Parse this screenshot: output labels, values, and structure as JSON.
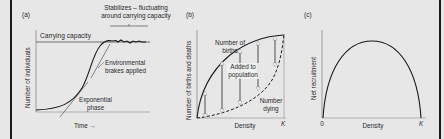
{
  "figure": {
    "background": "#e7e7e8",
    "panels": [
      {
        "label": "(a)",
        "y_axis_label": "Number of individuals",
        "x_axis_label": "Time →",
        "annotations": {
          "carrying_capacity": "Carrying capacity",
          "stabilizes_line1": "Stabilizes – fluctuating",
          "stabilizes_line2": "around carrying capacity",
          "environmental_line1": "Environmental",
          "environmental_line2": "brakes applied",
          "exponential_line1": "Exponential",
          "exponential_line2": "phase"
        }
      },
      {
        "label": "(b)",
        "y_axis_label": "Number of births and deaths",
        "x_axis_label": "Density",
        "x_end_tick": "K",
        "annotations": {
          "births_line1": "Number of",
          "births_line2": "births",
          "added_line1": "Added to",
          "added_line2": "population",
          "dying_line1": "Number",
          "dying_line2": "dying"
        }
      },
      {
        "label": "(c)",
        "y_axis_label": "Net recruitment",
        "x_axis_label": "Density",
        "x_start_tick": "0",
        "x_end_tick": "K"
      }
    ]
  }
}
